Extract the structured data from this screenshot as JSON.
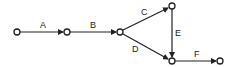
{
  "diagram": {
    "type": "activity-network",
    "nodes": [
      {
        "id": "n1",
        "x": 17,
        "y": 32
      },
      {
        "id": "n2",
        "x": 67,
        "y": 32
      },
      {
        "id": "n3",
        "x": 120,
        "y": 32
      },
      {
        "id": "n4",
        "x": 172,
        "y": 6
      },
      {
        "id": "n5",
        "x": 172,
        "y": 61
      },
      {
        "id": "n6",
        "x": 220,
        "y": 61
      }
    ],
    "edges": [
      {
        "label": "A",
        "from": "n1",
        "to": "n2"
      },
      {
        "label": "B",
        "from": "n2",
        "to": "n3"
      },
      {
        "label": "C",
        "from": "n3",
        "to": "n4"
      },
      {
        "label": "D",
        "from": "n3",
        "to": "n5"
      },
      {
        "label": "E",
        "from": "n4",
        "to": "n5"
      },
      {
        "label": "F",
        "from": "n5",
        "to": "n6"
      }
    ],
    "colors": {
      "stroke": "#222222",
      "node_fill": "#ffffff"
    }
  }
}
